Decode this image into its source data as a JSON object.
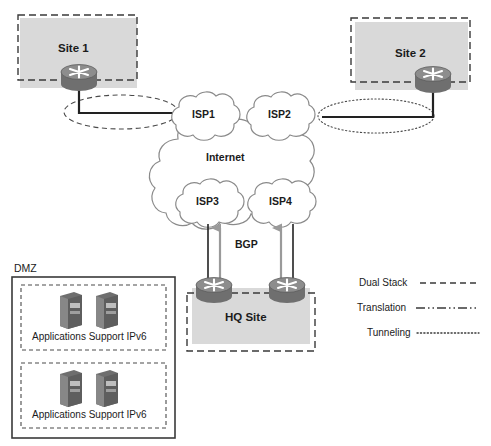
{
  "diagram": {
    "sites": {
      "site1": {
        "label": "Site 1"
      },
      "site2": {
        "label": "Site 2"
      },
      "hq": {
        "label": "HQ Site"
      }
    },
    "clouds": {
      "internet": {
        "label": "Internet"
      },
      "isp1": {
        "label": "ISP1"
      },
      "isp2": {
        "label": "ISP2"
      },
      "isp3": {
        "label": "ISP3"
      },
      "isp4": {
        "label": "ISP4"
      }
    },
    "protocol": {
      "bgp_label": "BGP"
    },
    "dmz": {
      "label": "DMZ",
      "groups": [
        {
          "label": "Applications Support IPv6"
        },
        {
          "label": "Applications Support IPv6"
        }
      ]
    },
    "legend": {
      "items": [
        {
          "label": "Dual Stack",
          "style": "dashed"
        },
        {
          "label": "Translation",
          "style": "dash-dot-dot"
        },
        {
          "label": "Tunneling",
          "style": "dotted"
        }
      ]
    },
    "colors": {
      "site_fill": "#d9d9d9",
      "router_body": "#7a7a7a",
      "router_top": "#8f8f8f",
      "server_body": "#6e6e6e",
      "line": "#2a2a2a",
      "cloud_stroke": "#8c8c8c",
      "text": "#1b1b1b",
      "arrow_gray": "#999999"
    }
  }
}
